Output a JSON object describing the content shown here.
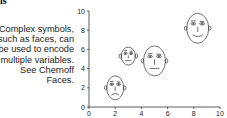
{
  "corner_text": "ls",
  "caption": "Complex symbols,\nsuch as faces, can\nbe used to encode\nmultiple variables.\nSee Chernoff\nFaces.",
  "chart_data": {
    "type": "scatter",
    "title": "",
    "xlabel": "",
    "ylabel": "",
    "xlim": [
      0,
      10
    ],
    "ylim": [
      0,
      10
    ],
    "x_ticks": [
      "0",
      "2",
      "4",
      "6",
      "8",
      "10"
    ],
    "y_ticks": [
      "0",
      "2",
      "4",
      "6",
      "8",
      "10"
    ],
    "grid": false,
    "marker": "chernoff-face",
    "points": [
      {
        "x": 2,
        "y": 2,
        "size": "medium",
        "expression": "frown"
      },
      {
        "x": 3,
        "y": 5.3,
        "size": "small",
        "expression": "neutral"
      },
      {
        "x": 5,
        "y": 4.8,
        "size": "large",
        "expression": "flat"
      },
      {
        "x": 8.3,
        "y": 8.2,
        "size": "large",
        "expression": "smile"
      }
    ]
  }
}
